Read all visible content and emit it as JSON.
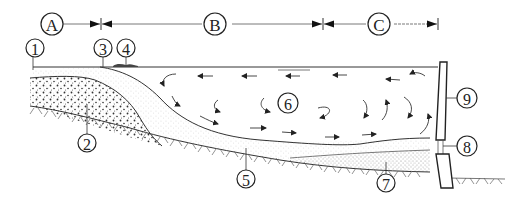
{
  "figure": {
    "type": "reservoir-sedimentation-cross-section",
    "zones": [
      {
        "id": "A",
        "label": "A"
      },
      {
        "id": "B",
        "label": "B"
      },
      {
        "id": "C",
        "label": "C"
      }
    ],
    "callouts": [
      {
        "id": "1",
        "label": "1"
      },
      {
        "id": "2",
        "label": "2"
      },
      {
        "id": "3",
        "label": "3"
      },
      {
        "id": "4",
        "label": "4"
      },
      {
        "id": "5",
        "label": "5"
      },
      {
        "id": "6",
        "label": "6"
      },
      {
        "id": "7",
        "label": "7"
      },
      {
        "id": "8",
        "label": "8"
      },
      {
        "id": "9",
        "label": "9"
      }
    ],
    "colors": {
      "ink": "#222222",
      "background": "#ffffff",
      "sediment_dots": "#444444"
    }
  }
}
